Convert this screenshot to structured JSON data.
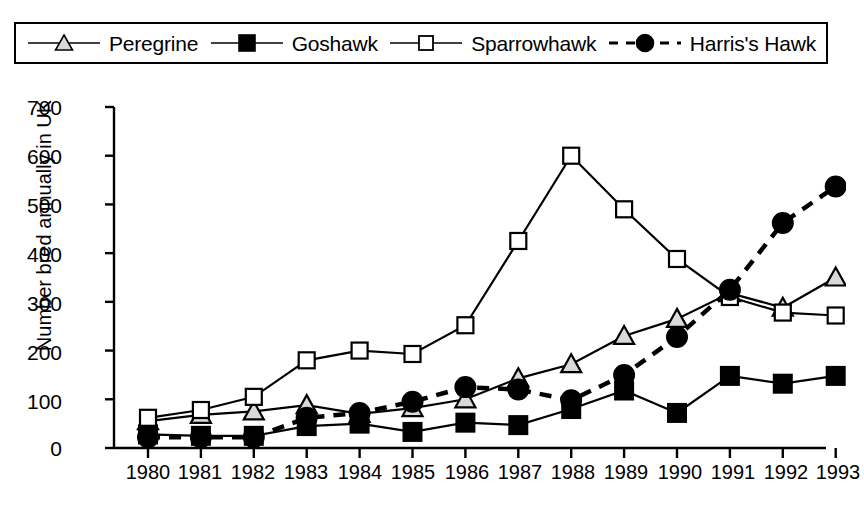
{
  "chart_data": {
    "type": "line",
    "title": "",
    "xlabel": "",
    "ylabel": "Number bred annually in UK",
    "categories": [
      "1980",
      "1981",
      "1982",
      "1983",
      "1984",
      "1985",
      "1986",
      "1987",
      "1988",
      "1989",
      "1990",
      "1991",
      "1992",
      "1993"
    ],
    "x": [
      1980,
      1981,
      1982,
      1983,
      1984,
      1985,
      1986,
      1987,
      1988,
      1989,
      1990,
      1991,
      1992,
      1993
    ],
    "ylim": [
      0,
      700
    ],
    "yticks": [
      0,
      100,
      200,
      300,
      400,
      500,
      600,
      700
    ],
    "grid": false,
    "legend_position": "top",
    "series": [
      {
        "name": "Peregrine",
        "marker": "open-triangle",
        "line": "solid",
        "color": "#000000",
        "values": [
          55,
          68,
          75,
          88,
          70,
          82,
          100,
          143,
          172,
          230,
          265,
          318,
          288,
          350
        ]
      },
      {
        "name": "Goshawk",
        "marker": "filled-square",
        "line": "solid",
        "color": "#000000",
        "values": [
          28,
          25,
          25,
          45,
          50,
          33,
          52,
          47,
          80,
          118,
          72,
          148,
          132,
          148
        ]
      },
      {
        "name": "Sparrowhawk",
        "marker": "open-square",
        "line": "solid",
        "color": "#000000",
        "values": [
          62,
          78,
          105,
          180,
          200,
          193,
          252,
          425,
          600,
          490,
          388,
          310,
          278,
          272
        ]
      },
      {
        "name": "Harris's Hawk",
        "marker": "filled-circle",
        "line": "dashed",
        "color": "#000000",
        "values": [
          22,
          22,
          22,
          62,
          72,
          95,
          125,
          120,
          98,
          150,
          228,
          325,
          462,
          537
        ]
      }
    ]
  },
  "legend": {
    "entries": [
      {
        "label": "Peregrine",
        "key": "open-triangle-line-key"
      },
      {
        "label": "Goshawk",
        "key": "filled-square-line-key"
      },
      {
        "label": "Sparrowhawk",
        "key": "open-square-line-key"
      },
      {
        "label": "Harris's Hawk",
        "key": "filled-circle-dashed-key"
      }
    ]
  },
  "axes": {
    "y_title": "Number bred annually in UK",
    "y_tick_labels": [
      "700",
      "600",
      "500",
      "400",
      "300",
      "200",
      "100",
      "0"
    ],
    "x_tick_labels": [
      "1980",
      "1981",
      "1982",
      "1983",
      "1984",
      "1985",
      "1986",
      "1987",
      "1988",
      "1989",
      "1990",
      "1991",
      "1992",
      "1993"
    ]
  }
}
